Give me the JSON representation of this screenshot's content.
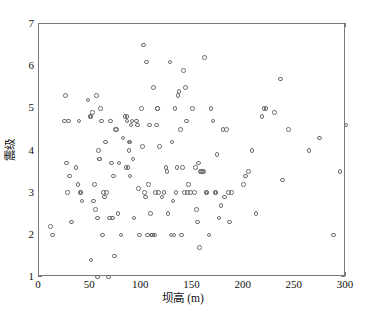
{
  "chart_data": {
    "type": "scatter",
    "title": "",
    "xlabel": "坝高 (m)",
    "ylabel": "震级",
    "xlim": [
      0,
      300
    ],
    "ylim": [
      1,
      7
    ],
    "xticks": [
      0,
      50,
      100,
      150,
      200,
      250,
      300
    ],
    "yticks": [
      1,
      2,
      3,
      4,
      5,
      6,
      7
    ],
    "xtick_labels": [
      "0",
      "50",
      "100",
      "150",
      "200",
      "250",
      "300"
    ],
    "ytick_labels": [
      "1",
      "2",
      "3",
      "4",
      "5",
      "6",
      "7"
    ],
    "grid": false,
    "legend": null,
    "marker": "open-circle",
    "marker_color": "#6e6e6e",
    "points": [
      [
        11,
        2.2
      ],
      [
        13,
        2.0
      ],
      [
        25,
        4.7
      ],
      [
        26,
        5.3
      ],
      [
        27,
        3.7
      ],
      [
        28,
        3.0
      ],
      [
        29,
        4.7
      ],
      [
        30,
        3.4
      ],
      [
        32,
        2.3
      ],
      [
        36,
        3.6
      ],
      [
        38,
        3.2
      ],
      [
        39,
        4.7
      ],
      [
        40,
        3.0
      ],
      [
        41,
        3.0
      ],
      [
        42,
        2.8
      ],
      [
        48,
        5.2
      ],
      [
        50,
        4.8
      ],
      [
        51,
        4.8
      ],
      [
        51,
        1.4
      ],
      [
        52,
        4.9
      ],
      [
        53,
        2.8
      ],
      [
        54,
        3.2
      ],
      [
        55,
        2.6
      ],
      [
        56,
        5.3
      ],
      [
        57,
        1.0
      ],
      [
        57,
        2.4
      ],
      [
        58,
        4.0
      ],
      [
        59,
        3.8
      ],
      [
        59,
        3.8
      ],
      [
        60,
        5.0
      ],
      [
        61,
        4.7
      ],
      [
        62,
        2.0
      ],
      [
        63,
        3.0
      ],
      [
        64,
        2.9
      ],
      [
        65,
        4.2
      ],
      [
        66,
        3.0
      ],
      [
        68,
        1.0
      ],
      [
        69,
        2.4
      ],
      [
        70,
        4.7
      ],
      [
        71,
        3.7
      ],
      [
        72,
        2.4
      ],
      [
        73,
        3.4
      ],
      [
        74,
        1.5
      ],
      [
        75,
        4.5
      ],
      [
        76,
        4.5
      ],
      [
        77,
        2.5
      ],
      [
        78,
        3.7
      ],
      [
        80,
        2.0
      ],
      [
        82,
        4.3
      ],
      [
        84,
        4.8
      ],
      [
        85,
        3.6
      ],
      [
        86,
        4.8
      ],
      [
        86,
        4.7
      ],
      [
        87,
        3.6
      ],
      [
        88,
        4.0
      ],
      [
        88,
        4.2
      ],
      [
        89,
        4.2
      ],
      [
        89,
        3.4
      ],
      [
        90,
        4.6
      ],
      [
        91,
        4.7
      ],
      [
        92,
        3.8
      ],
      [
        93,
        2.4
      ],
      [
        95,
        4.7
      ],
      [
        96,
        4.6
      ],
      [
        97,
        3.1
      ],
      [
        98,
        2.0
      ],
      [
        100,
        5.0
      ],
      [
        101,
        4.1
      ],
      [
        102,
        6.5
      ],
      [
        103,
        3.0
      ],
      [
        104,
        2.9
      ],
      [
        105,
        6.1
      ],
      [
        106,
        2.0
      ],
      [
        107,
        3.2
      ],
      [
        108,
        4.6
      ],
      [
        109,
        2.5
      ],
      [
        110,
        2.0
      ],
      [
        111,
        2.0
      ],
      [
        112,
        5.5
      ],
      [
        113,
        2.0
      ],
      [
        114,
        3.0
      ],
      [
        115,
        4.6
      ],
      [
        116,
        5.0
      ],
      [
        116,
        5.0
      ],
      [
        117,
        3.0
      ],
      [
        118,
        4.1
      ],
      [
        120,
        2.9
      ],
      [
        122,
        3.0
      ],
      [
        124,
        3.6
      ],
      [
        125,
        3.5
      ],
      [
        126,
        2.5
      ],
      [
        128,
        6.1
      ],
      [
        129,
        2.0
      ],
      [
        130,
        4.2
      ],
      [
        131,
        2.8
      ],
      [
        132,
        2.0
      ],
      [
        133,
        5.0
      ],
      [
        134,
        3.0
      ],
      [
        135,
        3.6
      ],
      [
        136,
        5.3
      ],
      [
        137,
        5.4
      ],
      [
        138,
        4.5
      ],
      [
        139,
        2.0
      ],
      [
        140,
        3.6
      ],
      [
        141,
        5.9
      ],
      [
        142,
        3.0
      ],
      [
        143,
        5.5
      ],
      [
        144,
        4.7
      ],
      [
        145,
        3.0
      ],
      [
        146,
        3.2
      ],
      [
        148,
        3.0
      ],
      [
        150,
        5.0
      ],
      [
        152,
        3.0
      ],
      [
        153,
        3.6
      ],
      [
        154,
        2.6
      ],
      [
        155,
        2.3
      ],
      [
        156,
        3.7
      ],
      [
        157,
        1.7
      ],
      [
        158,
        3.5
      ],
      [
        159,
        3.5
      ],
      [
        160,
        3.5
      ],
      [
        161,
        3.5
      ],
      [
        162,
        6.2
      ],
      [
        163,
        3.0
      ],
      [
        164,
        3.0
      ],
      [
        166,
        2.0
      ],
      [
        168,
        5.0
      ],
      [
        170,
        4.7
      ],
      [
        172,
        3.0
      ],
      [
        173,
        3.0
      ],
      [
        174,
        3.9
      ],
      [
        176,
        2.4
      ],
      [
        178,
        2.7
      ],
      [
        180,
        4.5
      ],
      [
        181,
        2.9
      ],
      [
        183,
        4.5
      ],
      [
        185,
        3.0
      ],
      [
        186,
        2.3
      ],
      [
        188,
        3.0
      ],
      [
        200,
        3.2
      ],
      [
        202,
        3.4
      ],
      [
        205,
        3.5
      ],
      [
        208,
        4.0
      ],
      [
        212,
        2.5
      ],
      [
        218,
        4.8
      ],
      [
        220,
        5.0
      ],
      [
        222,
        5.0
      ],
      [
        230,
        4.9
      ],
      [
        236,
        5.7
      ],
      [
        238,
        3.3
      ],
      [
        244,
        4.5
      ],
      [
        264,
        4.0
      ],
      [
        274,
        4.3
      ],
      [
        288,
        2.0
      ],
      [
        294,
        3.5
      ],
      [
        300,
        4.6
      ]
    ]
  }
}
